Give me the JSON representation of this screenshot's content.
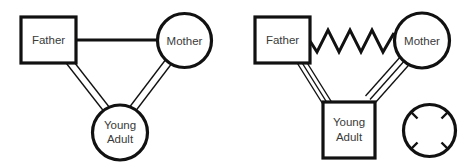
{
  "figure": {
    "background_color": "#ffffff",
    "stroke_color": "#111111",
    "label_color": "#3a3a3a",
    "width": 470,
    "height": 165
  },
  "panels": [
    {
      "id": "left-genogram",
      "name": "balanced-family-genogram",
      "nodes": [
        {
          "key": "father",
          "label": "Father",
          "shape": "square",
          "x": 21,
          "y": 17,
          "w": 55,
          "h": 46,
          "cx": 48.5,
          "cy": 40
        },
        {
          "key": "mother",
          "label": "Mother",
          "shape": "circle",
          "cx": 184.5,
          "cy": 40.5,
          "r": 27.5
        },
        {
          "key": "young_adult",
          "label_line1": "Young",
          "label_line2": "Adult",
          "shape": "circle",
          "cx": 120,
          "cy": 132.5,
          "r": 28
        }
      ],
      "relations": [
        {
          "key": "father-mother",
          "from": "father",
          "to": "mother",
          "style": "single-line",
          "meaning": "marital-bond"
        },
        {
          "key": "father-young-adult",
          "from": "father",
          "to": "young_adult",
          "style": "double-line",
          "meaning": "close-relationship"
        },
        {
          "key": "mother-young-adult",
          "from": "mother",
          "to": "young_adult",
          "style": "double-line",
          "meaning": "close-relationship"
        }
      ]
    },
    {
      "id": "right-genogram",
      "name": "conflicted-family-genogram",
      "nodes": [
        {
          "key": "father",
          "label": "Father",
          "shape": "square",
          "x": 255,
          "y": 17,
          "w": 55,
          "h": 46,
          "cx": 282.5,
          "cy": 40
        },
        {
          "key": "mother",
          "label": "Mother",
          "shape": "circle",
          "cx": 422,
          "cy": 40.5,
          "r": 28
        },
        {
          "key": "young_adult",
          "label_line1": "Young",
          "label_line2": "Adult",
          "shape": "square",
          "x": 323,
          "y": 102,
          "w": 52,
          "h": 56,
          "cx": 349,
          "cy": 130
        },
        {
          "key": "marker_circle",
          "label": "",
          "shape": "circle-with-ticks",
          "cx": 429.5,
          "cy": 130.5,
          "r": 26.5,
          "tick_count": 4,
          "tick_angles_deg": [
            45,
            135,
            225,
            315
          ]
        }
      ],
      "relations": [
        {
          "key": "father-mother",
          "from": "father",
          "to": "mother",
          "style": "zigzag",
          "meaning": "conflictual",
          "zigzag_peaks": 4
        },
        {
          "key": "father-young-adult",
          "from": "father",
          "to": "young_adult",
          "style": "triple-line",
          "meaning": "fused-enmeshed"
        },
        {
          "key": "mother-young-adult",
          "from": "mother",
          "to": "young_adult",
          "style": "triple-line",
          "meaning": "fused-enmeshed"
        }
      ]
    }
  ],
  "labels": {
    "father": "Father",
    "mother": "Mother",
    "young_adult_line1": "Young",
    "young_adult_line2": "Adult"
  }
}
